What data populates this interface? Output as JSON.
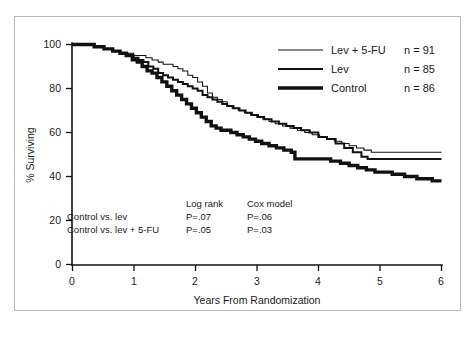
{
  "figure": {
    "border_color": "#b9b9b9",
    "background": "#ffffff",
    "ink_color": "#111111"
  },
  "axes": {
    "y_axis_title": "% Surviving",
    "y_ticks": [
      "0",
      "20",
      "40",
      "60",
      "80",
      "100"
    ],
    "x_axis_title": "Years From Randomization",
    "x_ticks": [
      "0",
      "1",
      "2",
      "3",
      "4",
      "5",
      "6"
    ]
  },
  "legend": {
    "entries": [
      {
        "label": "Lev + 5-FU",
        "count": "n = 91",
        "weight": "thin"
      },
      {
        "label": "Lev",
        "count": "n = 85",
        "weight": "medium"
      },
      {
        "label": "Control",
        "count": "n = 86",
        "weight": "thick"
      }
    ]
  },
  "stats": {
    "col_header_1": "Log rank",
    "col_header_2": "Cox model",
    "rows": [
      {
        "comparison": "Control vs. lev",
        "log_rank": "P=.07",
        "cox": "P=.06"
      },
      {
        "comparison": "Control vs. lev + 5-FU",
        "log_rank": "P=.05",
        "cox": "P=.03"
      }
    ]
  },
  "caption_strip": "",
  "chart_data": {
    "type": "line",
    "title": "",
    "subtitle": "",
    "xlabel": "Years From Randomization",
    "ylabel": "% Surviving",
    "xlim": [
      0,
      6
    ],
    "ylim": [
      0,
      100
    ],
    "xticks": [
      0,
      1,
      2,
      3,
      4,
      5,
      6
    ],
    "yticks": [
      0,
      20,
      40,
      60,
      80,
      100
    ],
    "grid": false,
    "legend_position": "top-right",
    "step_style": "post",
    "annotations": [
      "Control vs. lev  Log rank P=.07  Cox model P=.06",
      "Control vs. lev + 5-FU  Log rank P=.05  Cox model P=.03"
    ],
    "series": [
      {
        "name": "Lev + 5-FU",
        "n": 91,
        "line_weight": "thin",
        "final_value": 51,
        "x": [
          0,
          0.18,
          0.36,
          0.52,
          0.66,
          0.78,
          0.9,
          1.0,
          1.1,
          1.2,
          1.3,
          1.4,
          1.48,
          1.56,
          1.64,
          1.72,
          1.8,
          1.88,
          1.96,
          2.04,
          2.12,
          2.2,
          2.28,
          2.36,
          2.44,
          2.52,
          2.6,
          2.7,
          2.8,
          2.9,
          3.0,
          3.1,
          3.2,
          3.3,
          3.42,
          3.54,
          3.66,
          3.78,
          3.9,
          4.02,
          4.14,
          4.26,
          4.38,
          4.5,
          4.62,
          4.74,
          4.86,
          5.0,
          5.3,
          5.6,
          6.0
        ],
        "y": [
          100,
          100,
          99,
          98,
          97,
          96,
          96,
          95,
          95,
          94,
          93,
          92,
          91,
          91,
          90,
          89,
          88,
          86,
          85,
          83,
          81,
          78,
          76,
          75,
          74,
          72,
          71,
          70,
          69,
          68,
          67,
          66,
          65,
          64,
          63,
          62,
          61,
          60,
          59,
          58,
          57,
          56,
          55,
          54,
          53,
          52,
          51,
          51,
          51,
          51,
          51
        ]
      },
      {
        "name": "Lev",
        "n": 85,
        "line_weight": "medium",
        "final_value": 48,
        "x": [
          0,
          0.18,
          0.36,
          0.52,
          0.66,
          0.78,
          0.9,
          1.0,
          1.08,
          1.16,
          1.24,
          1.32,
          1.4,
          1.48,
          1.56,
          1.64,
          1.72,
          1.8,
          1.88,
          1.96,
          2.04,
          2.12,
          2.2,
          2.28,
          2.36,
          2.44,
          2.52,
          2.62,
          2.72,
          2.82,
          2.92,
          3.02,
          3.12,
          3.24,
          3.36,
          3.48,
          3.6,
          3.72,
          3.86,
          4.0,
          4.14,
          4.28,
          4.42,
          4.56,
          4.7,
          4.8,
          5.0,
          5.4,
          5.7,
          6.0
        ],
        "y": [
          100,
          100,
          99,
          98,
          97,
          96,
          95,
          94,
          93,
          92,
          90,
          89,
          87,
          86,
          85,
          84,
          83,
          82,
          81,
          80,
          79,
          77,
          76,
          75,
          74,
          73,
          72,
          71,
          70,
          69,
          68,
          67,
          66,
          65,
          64,
          63,
          62,
          61,
          60,
          58,
          57,
          55,
          53,
          51,
          49,
          48,
          48,
          48,
          48,
          48
        ]
      },
      {
        "name": "Control",
        "n": 86,
        "line_weight": "thick",
        "final_value": 38,
        "x": [
          0,
          0.18,
          0.36,
          0.52,
          0.66,
          0.78,
          0.88,
          0.98,
          1.06,
          1.14,
          1.22,
          1.3,
          1.38,
          1.46,
          1.54,
          1.62,
          1.7,
          1.78,
          1.86,
          1.94,
          2.02,
          2.1,
          2.18,
          2.26,
          2.34,
          2.42,
          2.5,
          2.58,
          2.68,
          2.78,
          2.88,
          2.98,
          3.08,
          3.2,
          3.32,
          3.44,
          3.56,
          3.62,
          3.8,
          4.0,
          4.2,
          4.36,
          4.5,
          4.64,
          4.78,
          4.92,
          5.06,
          5.2,
          5.4,
          5.6,
          5.85,
          6.0
        ],
        "y": [
          100,
          100,
          99,
          98,
          97,
          96,
          95,
          93,
          92,
          90,
          88,
          87,
          85,
          83,
          81,
          79,
          77,
          75,
          73,
          71,
          69,
          67,
          65,
          63,
          62,
          61,
          61,
          60,
          59,
          58,
          57,
          56,
          55,
          54,
          53,
          52,
          51,
          48,
          48,
          48,
          47,
          46,
          45,
          44,
          43,
          42,
          42,
          41,
          40,
          39,
          38,
          38
        ]
      }
    ]
  }
}
